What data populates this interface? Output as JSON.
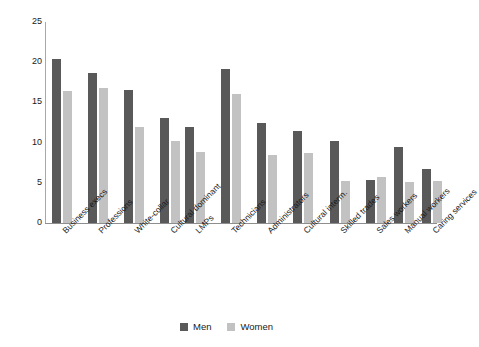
{
  "chart_data": {
    "type": "bar",
    "title": "",
    "subtitle": "",
    "xlabel": "",
    "ylabel": "",
    "ylim": [
      0,
      25
    ],
    "yticks": [
      0,
      5,
      10,
      15,
      20,
      25
    ],
    "grid": false,
    "legend_position": "bottom-center",
    "categories": [
      "Business execs",
      "Professions",
      "White-collar",
      "Cultural dominant",
      "LMPs",
      "Technicians",
      "Administrators",
      "Cultural interm.",
      "Skilled trades",
      "Sales workers",
      "Manual workers",
      "Caring services"
    ],
    "group_breaks_after": [
      3,
      7
    ],
    "series": [
      {
        "name": "Men",
        "color": "#595959",
        "values": [
          20.4,
          18.6,
          16.5,
          13.0,
          11.9,
          19.2,
          12.4,
          11.5,
          10.2,
          5.3,
          9.4,
          6.7
        ]
      },
      {
        "name": "Women",
        "color": "#c2c2c2",
        "values": [
          16.4,
          16.8,
          11.9,
          10.2,
          8.8,
          16.0,
          8.4,
          8.7,
          5.2,
          5.7,
          5.1,
          5.2
        ]
      }
    ]
  },
  "legend": {
    "items": [
      {
        "label": "Men",
        "color": "#595959"
      },
      {
        "label": "Women",
        "color": "#c2c2c2"
      }
    ]
  },
  "axis": {
    "y_tick_labels": [
      "25",
      "20",
      "15",
      "10",
      "5",
      "0"
    ]
  }
}
